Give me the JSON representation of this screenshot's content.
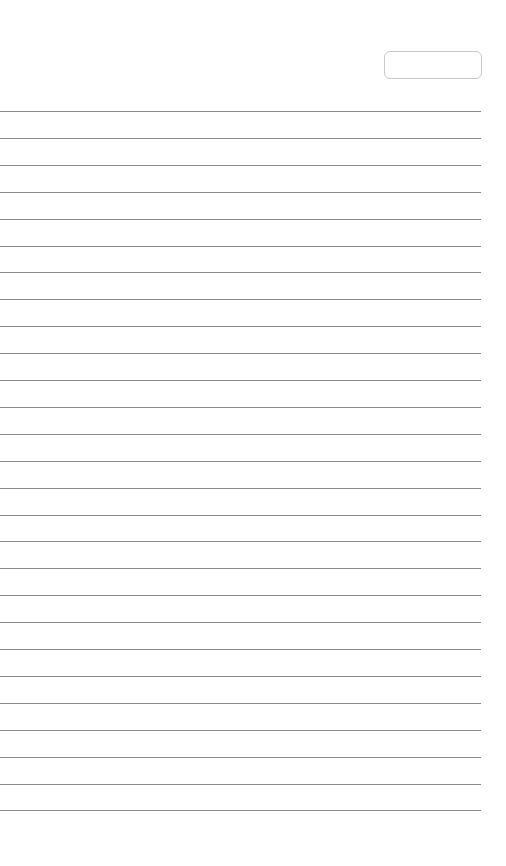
{
  "page": {
    "type": "lined-notebook-page",
    "background_color": "#ffffff",
    "line_color": "#8a8a8a",
    "date_box": {
      "value": ""
    },
    "line_count": 27,
    "first_line_y": 111,
    "line_spacing": 26.9
  }
}
